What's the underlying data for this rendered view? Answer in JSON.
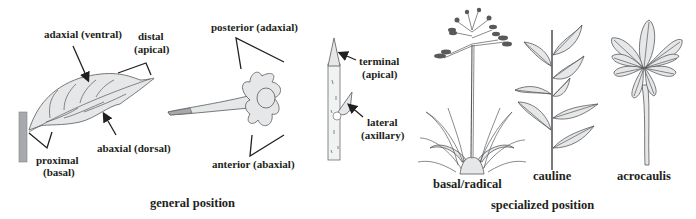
{
  "general_position": {
    "caption": "general position",
    "leaf": {
      "adaxial": "adaxial (ventral)",
      "distal_1": "distal",
      "distal_2": "(apical)",
      "abaxial": "abaxial (dorsal)",
      "proximal_1": "proximal",
      "proximal_2": "(basal)"
    },
    "flower": {
      "posterior": "posterior (adaxial)",
      "anterior": "anterior (abaxial)"
    },
    "stem": {
      "terminal_1": "terminal",
      "terminal_2": "(apical)",
      "lateral_1": "lateral",
      "lateral_2": "(axillary)"
    }
  },
  "specialized_position": {
    "caption": "specialized position",
    "types": [
      {
        "label": "basal/radical"
      },
      {
        "label": "cauline"
      },
      {
        "label": "acrocaulis"
      }
    ]
  }
}
